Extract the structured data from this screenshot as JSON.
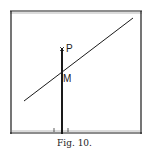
{
  "figure": {
    "caption": "Fig. 10.",
    "labels": {
      "point_p": "P",
      "point_m": "M"
    },
    "colors": {
      "ink": "#1a1a1a",
      "background": "#ffffff"
    }
  }
}
